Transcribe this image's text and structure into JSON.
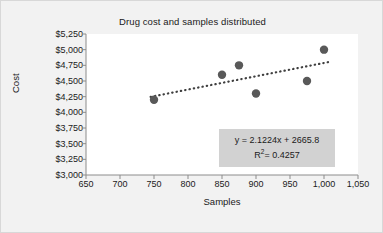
{
  "chart_data": {
    "type": "scatter",
    "title": "Drug cost and samples distributed",
    "xlabel": "Samples",
    "ylabel": "Cost",
    "xlim": [
      650,
      1050
    ],
    "ylim": [
      3000,
      5250
    ],
    "xticks": [
      650,
      700,
      750,
      800,
      850,
      900,
      950,
      1000,
      1050
    ],
    "xtick_labels": [
      "650",
      "700",
      "750",
      "800",
      "850",
      "900",
      "950",
      "1,000",
      "1,050"
    ],
    "yticks": [
      3000,
      3250,
      3500,
      3750,
      4000,
      4250,
      4500,
      4750,
      5000,
      5250
    ],
    "ytick_labels": [
      "$3,000",
      "$3,250",
      "$3,500",
      "$3,750",
      "$4,000",
      "$4,250",
      "$4,500",
      "$4,750",
      "$5,000",
      "$5,250"
    ],
    "grid": false,
    "legend": "none",
    "marker_color": "#595959",
    "points": [
      {
        "x": 750,
        "y": 4200
      },
      {
        "x": 850,
        "y": 4600
      },
      {
        "x": 875,
        "y": 4750
      },
      {
        "x": 900,
        "y": 4300
      },
      {
        "x": 975,
        "y": 4500
      },
      {
        "x": 1000,
        "y": 5000
      }
    ],
    "trendline": {
      "type": "linear-dotted",
      "slope": 2.1224,
      "intercept": 2665.8,
      "x_start": 745,
      "x_end": 1008,
      "color": "#3f3f3f"
    },
    "annotation": {
      "equation": "y = 2.1224x + 2665.8",
      "r_squared_prefix": "R",
      "r_squared_sup": "2",
      "r_squared_value": "= 0.4257",
      "background": "#d2d2d2"
    }
  }
}
